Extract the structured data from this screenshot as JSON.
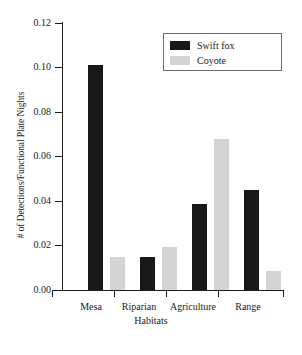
{
  "chart_data": {
    "type": "bar",
    "title": "",
    "xlabel": "Habitats",
    "ylabel": "# of Detections/Functional Plate Nights",
    "categories": [
      "Mesa",
      "Riparian",
      "Agriculture",
      "Range"
    ],
    "series": [
      {
        "name": "Swift fox",
        "color": "#181818",
        "values": [
          0.101,
          0.015,
          0.0385,
          0.045
        ]
      },
      {
        "name": "Coyote",
        "color": "#d4d4d4",
        "values": [
          0.015,
          0.0195,
          0.068,
          0.0085
        ]
      }
    ],
    "ylim": [
      0.0,
      0.12
    ],
    "ytick_values": [
      0.0,
      0.02,
      0.04,
      0.06,
      0.08,
      0.1,
      0.12
    ],
    "ytick_labels": [
      "0.00",
      "0.02",
      "0.04",
      "0.06",
      "0.08",
      "0.10",
      "0.12"
    ],
    "grid": false,
    "legend_position": "top-right",
    "legend_entries": [
      "Swift fox",
      "Coyote"
    ]
  },
  "axes": {
    "y_title": "# of Detections/Functional Plate Nights",
    "x_title": "Habitats",
    "y_labels": {
      "t0": "0.00",
      "t1": "0.02",
      "t2": "0.04",
      "t3": "0.06",
      "t4": "0.08",
      "t5": "0.10",
      "t6": "0.12"
    },
    "x_labels": {
      "c0": "Mesa",
      "c1": "Riparian",
      "c2": "Agriculture",
      "c3": "Range"
    }
  },
  "legend": {
    "series_1_label": "Swift fox",
    "series_2_label": "Coyote"
  }
}
